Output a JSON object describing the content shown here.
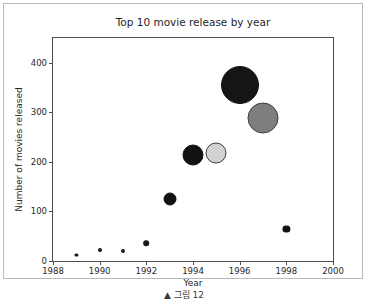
{
  "figure": {
    "caption": "▲ 그림 12"
  },
  "chart_data": {
    "type": "scatter",
    "title": "Top 10 movie release by year",
    "xlabel": "Year",
    "ylabel": "Number of movies released",
    "xlim": [
      1988,
      2000
    ],
    "ylim": [
      0,
      450
    ],
    "xticks": [
      1988,
      1990,
      1992,
      1994,
      1996,
      1998,
      2000
    ],
    "xtick_labels": [
      "1988",
      "1990",
      "1992",
      "1994",
      "1996",
      "1998",
      "2000"
    ],
    "yticks": [
      0,
      100,
      200,
      300,
      400
    ],
    "ytick_labels": [
      "0",
      "100",
      "200",
      "300",
      "400"
    ],
    "grid": false,
    "legend": null,
    "x": [
      1989,
      1990,
      1991,
      1992,
      1993,
      1994,
      1995,
      1996,
      1997,
      1998
    ],
    "y": [
      13,
      22,
      20,
      36,
      125,
      213,
      218,
      355,
      288,
      64
    ],
    "sizes": [
      3,
      4,
      4,
      6,
      13,
      21,
      21,
      38,
      31,
      7
    ],
    "colors": [
      "#1a1a1a",
      "#1a1a1a",
      "#1a1a1a",
      "#1a1a1a",
      "#111111",
      "#111111",
      "#d2d2d2",
      "#151515",
      "#7e7e7e",
      "#111111"
    ],
    "edge_colors": [
      "#1a1a1a",
      "#1a1a1a",
      "#1a1a1a",
      "#1a1a1a",
      "#111111",
      "#111111",
      "#3d3d3d",
      "#151515",
      "#3d3d3d",
      "#111111"
    ],
    "points": [
      {
        "year": 1989,
        "value": 13,
        "radius": 1.6,
        "fill": "#1a1a1a",
        "edge": "#1a1a1a"
      },
      {
        "year": 1990,
        "value": 22,
        "radius": 2.0,
        "fill": "#1a1a1a",
        "edge": "#1a1a1a"
      },
      {
        "year": 1991,
        "value": 20,
        "radius": 2.0,
        "fill": "#1a1a1a",
        "edge": "#1a1a1a"
      },
      {
        "year": 1992,
        "value": 36,
        "radius": 2.8,
        "fill": "#1a1a1a",
        "edge": "#1a1a1a"
      },
      {
        "year": 1993,
        "value": 125,
        "radius": 6.5,
        "fill": "#111111",
        "edge": "#111111"
      },
      {
        "year": 1994,
        "value": 213,
        "radius": 10.5,
        "fill": "#111111",
        "edge": "#111111"
      },
      {
        "year": 1995,
        "value": 218,
        "radius": 10.5,
        "fill": "#d2d2d2",
        "edge": "#3d3d3d"
      },
      {
        "year": 1996,
        "value": 355,
        "radius": 19.0,
        "fill": "#151515",
        "edge": "#151515"
      },
      {
        "year": 1997,
        "value": 288,
        "radius": 15.5,
        "fill": "#7e7e7e",
        "edge": "#3d3d3d"
      },
      {
        "year": 1998,
        "value": 64,
        "radius": 3.6,
        "fill": "#111111",
        "edge": "#111111"
      }
    ]
  }
}
